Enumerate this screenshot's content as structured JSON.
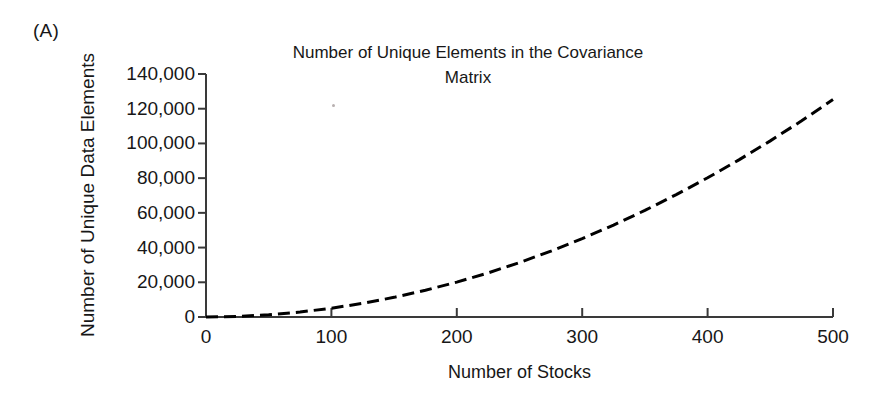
{
  "panel": {
    "label": "(A)"
  },
  "chart_data": {
    "type": "line",
    "title": "Number of Unique Elements in the Covariance Matrix",
    "title_lines": [
      "Number of Unique Elements in the Covariance",
      "Matrix"
    ],
    "xlabel": "Number of Stocks",
    "ylabel": "Number of Unique Data Elements",
    "xlim": [
      0,
      500
    ],
    "ylim": [
      0,
      140000
    ],
    "grid": false,
    "legend": null,
    "line_style": "dashed",
    "line_color": "#000000",
    "line_width": 3,
    "xticks": [
      0,
      100,
      200,
      300,
      400,
      500
    ],
    "xtick_labels": [
      "0",
      "100",
      "200",
      "300",
      "400",
      "500"
    ],
    "yticks": [
      0,
      20000,
      40000,
      60000,
      80000,
      100000,
      120000,
      140000
    ],
    "ytick_labels": [
      "0",
      "20,000",
      "40,000",
      "60,000",
      "80,000",
      "100,000",
      "120,000",
      "140,000"
    ],
    "series": [
      {
        "name": "Unique covariance elements n(n+1)/2",
        "x": [
          0,
          25,
          50,
          75,
          100,
          125,
          150,
          175,
          200,
          225,
          250,
          275,
          300,
          325,
          350,
          375,
          400,
          425,
          450,
          475,
          500
        ],
        "y": [
          0,
          325,
          1275,
          2850,
          5050,
          7875,
          11325,
          15400,
          20100,
          25425,
          31375,
          37950,
          45150,
          52975,
          61425,
          70500,
          80200,
          90525,
          101475,
          113050,
          125250
        ]
      }
    ]
  },
  "colors": {
    "axis": "#3a3a3a",
    "text": "#171717",
    "line": "#000000",
    "background": "#ffffff"
  }
}
